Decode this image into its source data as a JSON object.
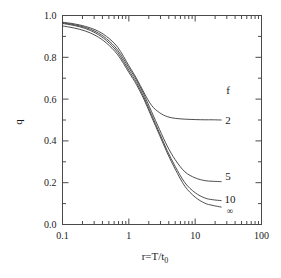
{
  "chart_data": {
    "type": "line",
    "title": "",
    "xlabel": "r=T/t_0",
    "xlabel_parts": {
      "main": "r=T/t",
      "sub": "0"
    },
    "ylabel": "q",
    "xscale": "log",
    "yscale": "linear",
    "xlim": [
      0.1,
      100
    ],
    "ylim": [
      0.0,
      1.0
    ],
    "grid": false,
    "legend_position": "right-inside",
    "legend_title": "f",
    "xticks": [
      "0.1",
      "1",
      "10",
      "100"
    ],
    "xtick_values": [
      0.1,
      1,
      10,
      100
    ],
    "yticks": [
      "0.0",
      "0.2",
      "0.4",
      "0.6",
      "0.8",
      "1.0"
    ],
    "ytick_values": [
      0.0,
      0.2,
      0.4,
      0.6,
      0.8,
      1.0
    ],
    "series": [
      {
        "name": "2",
        "label": "2",
        "plateau": 0.5,
        "x": [
          0.1,
          0.15,
          0.22,
          0.32,
          0.46,
          0.68,
          1.0,
          1.3,
          1.7,
          2.2,
          2.9,
          3.8,
          5.0,
          7.0,
          10.0,
          14.0,
          18.0,
          25.0
        ],
        "y": [
          0.968,
          0.96,
          0.948,
          0.93,
          0.9,
          0.848,
          0.76,
          0.7,
          0.63,
          0.57,
          0.535,
          0.516,
          0.508,
          0.504,
          0.502,
          0.501,
          0.501,
          0.5
        ]
      },
      {
        "name": "5",
        "label": "5",
        "plateau": 0.205,
        "x": [
          0.1,
          0.15,
          0.22,
          0.32,
          0.46,
          0.68,
          1.0,
          1.3,
          1.7,
          2.2,
          2.9,
          3.8,
          5.0,
          7.0,
          10.0,
          14.0,
          18.0,
          25.0
        ],
        "y": [
          0.965,
          0.956,
          0.943,
          0.922,
          0.889,
          0.834,
          0.75,
          0.692,
          0.62,
          0.54,
          0.455,
          0.375,
          0.31,
          0.252,
          0.223,
          0.21,
          0.207,
          0.205
        ]
      },
      {
        "name": "10",
        "label": "10",
        "plateau": 0.115,
        "x": [
          0.1,
          0.15,
          0.22,
          0.32,
          0.46,
          0.68,
          1.0,
          1.3,
          1.7,
          2.2,
          2.9,
          3.8,
          5.0,
          7.0,
          10.0,
          14.0,
          18.0,
          25.0
        ],
        "y": [
          0.962,
          0.952,
          0.938,
          0.915,
          0.88,
          0.823,
          0.738,
          0.68,
          0.607,
          0.525,
          0.438,
          0.353,
          0.278,
          0.2,
          0.152,
          0.127,
          0.119,
          0.114
        ]
      },
      {
        "name": "inf",
        "label": "∞",
        "plateau": 0.085,
        "x": [
          0.1,
          0.15,
          0.22,
          0.32,
          0.46,
          0.68,
          1.0,
          1.3,
          1.7,
          2.2,
          2.9,
          3.8,
          5.0,
          7.0,
          10.0,
          14.0,
          18.0,
          25.0
        ],
        "y": [
          0.95,
          0.94,
          0.926,
          0.903,
          0.868,
          0.812,
          0.728,
          0.67,
          0.597,
          0.515,
          0.428,
          0.342,
          0.265,
          0.183,
          0.131,
          0.102,
          0.092,
          0.083
        ]
      }
    ],
    "curve_labels": [
      {
        "text": "f",
        "value": ""
      },
      {
        "text": "2",
        "value": "2"
      },
      {
        "text": "5",
        "value": "5"
      },
      {
        "text": "10",
        "value": "10"
      },
      {
        "text": "∞",
        "value": "inf"
      }
    ],
    "colors": {
      "curve": "#3a3a3a",
      "axis": "#4a4a4a",
      "text": "#1a1a1a",
      "background": "#ffffff"
    }
  }
}
